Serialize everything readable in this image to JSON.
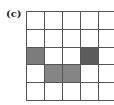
{
  "figure": {
    "label": "(c)",
    "grid": {
      "rows": 5,
      "cols": 5,
      "cells": [
        [
          "#ffffff",
          "#ffffff",
          "#ffffff",
          "#ffffff",
          "#ffffff"
        ],
        [
          "#ffffff",
          "#ffffff",
          "#ffffff",
          "#ffffff",
          "#ffffff"
        ],
        [
          "#7c7c7c",
          "#ffffff",
          "#ffffff",
          "#5c5c5c",
          "#ffffff"
        ],
        [
          "#ffffff",
          "#858585",
          "#858585",
          "#ffffff",
          "#ffffff"
        ],
        [
          "#ffffff",
          "#ffffff",
          "#ffffff",
          "#ffffff",
          "#ffffff"
        ]
      ]
    }
  }
}
